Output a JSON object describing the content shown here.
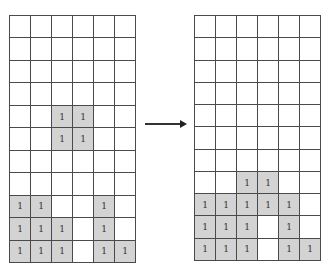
{
  "diagram": {
    "rows": 11,
    "cols": 6,
    "cell_label": "1",
    "colors": {
      "filled": "#d3d3d3",
      "empty": "#ffffff",
      "line": "#4a4a4a"
    },
    "left_grid": [
      [
        0,
        0,
        0,
        0,
        0,
        0
      ],
      [
        0,
        0,
        0,
        0,
        0,
        0
      ],
      [
        0,
        0,
        0,
        0,
        0,
        0
      ],
      [
        0,
        0,
        0,
        0,
        0,
        0
      ],
      [
        0,
        0,
        1,
        1,
        0,
        0
      ],
      [
        0,
        0,
        1,
        1,
        0,
        0
      ],
      [
        0,
        0,
        0,
        0,
        0,
        0
      ],
      [
        0,
        0,
        0,
        0,
        0,
        0
      ],
      [
        1,
        1,
        0,
        0,
        1,
        0
      ],
      [
        1,
        1,
        1,
        0,
        1,
        0
      ],
      [
        1,
        1,
        1,
        0,
        1,
        1
      ]
    ],
    "right_grid": [
      [
        0,
        0,
        0,
        0,
        0,
        0
      ],
      [
        0,
        0,
        0,
        0,
        0,
        0
      ],
      [
        0,
        0,
        0,
        0,
        0,
        0
      ],
      [
        0,
        0,
        0,
        0,
        0,
        0
      ],
      [
        0,
        0,
        0,
        0,
        0,
        0
      ],
      [
        0,
        0,
        0,
        0,
        0,
        0
      ],
      [
        0,
        0,
        0,
        0,
        0,
        0
      ],
      [
        0,
        0,
        1,
        1,
        0,
        0
      ],
      [
        1,
        1,
        1,
        1,
        1,
        0
      ],
      [
        1,
        1,
        1,
        0,
        1,
        0
      ],
      [
        1,
        1,
        1,
        0,
        1,
        1
      ]
    ],
    "arrow": "right-arrow"
  }
}
